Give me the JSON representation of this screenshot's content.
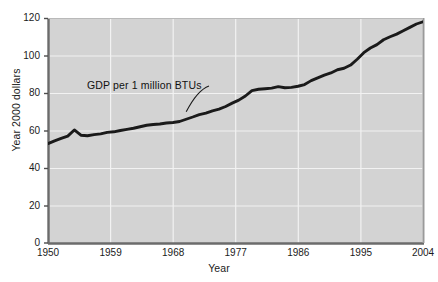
{
  "chart_data": {
    "type": "line",
    "title": "",
    "xlabel": "Year",
    "ylabel": "Year 2000 dollars",
    "xlim": [
      1950,
      2007
    ],
    "ylim": [
      0,
      120
    ],
    "xticks": [
      "1950",
      "1959",
      "1968",
      "1977",
      "1986",
      "1995",
      "2004"
    ],
    "yticks": [
      "0",
      "20",
      "40",
      "60",
      "80",
      "100",
      "120"
    ],
    "grid": true,
    "legend_position": "inline-annotation",
    "annotations": [
      {
        "text": "GDP per 1 million BTUs",
        "x": 1962,
        "y": 86,
        "leader_to_x": 1971,
        "leader_to_y": 70
      }
    ],
    "series": [
      {
        "name": "GDP per 1 million BTUs",
        "color": "#1a1a1a",
        "x": [
          1950,
          1951,
          1952,
          1953,
          1954,
          1955,
          1956,
          1957,
          1958,
          1959,
          1960,
          1961,
          1962,
          1963,
          1964,
          1965,
          1966,
          1967,
          1968,
          1969,
          1970,
          1971,
          1972,
          1973,
          1974,
          1975,
          1976,
          1977,
          1978,
          1979,
          1980,
          1981,
          1982,
          1983,
          1984,
          1985,
          1986,
          1987,
          1988,
          1989,
          1990,
          1991,
          1992,
          1993,
          1994,
          1995,
          1996,
          1997,
          1998,
          1999,
          2000,
          2001,
          2002,
          2003,
          2004,
          2005,
          2006,
          2007
        ],
        "values": [
          53.0,
          54.5,
          55.8,
          57.0,
          60.3,
          57.5,
          57.2,
          57.8,
          58.2,
          59.0,
          59.3,
          60.0,
          60.6,
          61.2,
          62.0,
          62.8,
          63.2,
          63.5,
          64.0,
          64.3,
          64.8,
          66.0,
          67.2,
          68.5,
          69.3,
          70.5,
          71.4,
          72.8,
          74.6,
          76.2,
          78.4,
          81.3,
          82.0,
          82.3,
          82.6,
          83.4,
          82.8,
          83.0,
          83.6,
          84.5,
          86.6,
          88.1,
          89.5,
          90.7,
          92.4,
          93.2,
          94.9,
          98.0,
          101.5,
          104.0,
          105.8,
          108.4,
          110.0,
          111.4,
          113.2,
          115.0,
          116.8,
          118.0
        ]
      }
    ]
  },
  "axes": {
    "ylabel": "Year 2000 dollars",
    "xlabel": "Year"
  }
}
